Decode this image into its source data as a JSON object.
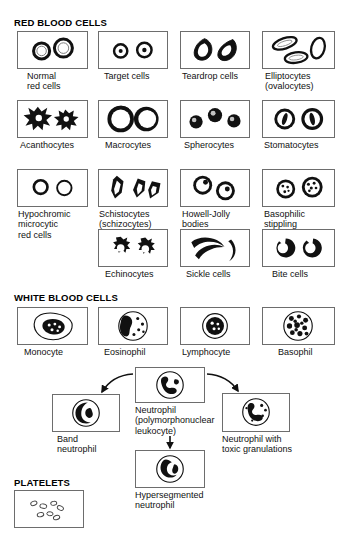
{
  "page": {
    "background": "#ffffff",
    "ink": "#000000",
    "box_border": "#6d6d6d"
  },
  "sections": {
    "rbc_header": "RED BLOOD CELLS",
    "wbc_header": "WHITE BLOOD CELLS",
    "platelets_header": "PLATELETS"
  },
  "red_blood_cells": {
    "row1": [
      {
        "id": "normal-red-cells",
        "label": "Normal\nred cells",
        "icon": "normal-rbc-icon"
      },
      {
        "id": "target-cells",
        "label": "Target cells",
        "icon": "target-cell-icon"
      },
      {
        "id": "teardrop-cells",
        "label": "Teardrop cells",
        "icon": "teardrop-cell-icon"
      },
      {
        "id": "elliptocytes",
        "label": "Elliptocytes\n(ovalocytes)",
        "icon": "elliptocyte-icon"
      }
    ],
    "row2": [
      {
        "id": "acanthocytes",
        "label": "Acanthocytes",
        "icon": "acanthocyte-icon"
      },
      {
        "id": "macrocytes",
        "label": "Macrocytes",
        "icon": "macrocyte-icon"
      },
      {
        "id": "spherocytes",
        "label": "Spherocytes",
        "icon": "spherocyte-icon"
      },
      {
        "id": "stomatocytes",
        "label": "Stomatocytes",
        "icon": "stomatocyte-icon"
      }
    ],
    "row3": [
      {
        "id": "hypochromic-microcytic-red-cells",
        "label": "Hypochromic\nmicrocytic\nred cells",
        "icon": "hypochromic-icon"
      },
      {
        "id": "schistocytes",
        "label": "Schistocytes\n(schizocytes)",
        "icon": "schistocyte-icon"
      },
      {
        "id": "howell-jolly-bodies",
        "label": "Howell-Jolly\nbodies",
        "icon": "howell-jolly-icon"
      },
      {
        "id": "basophilic-stippling",
        "label": "Basophilic\nstippling",
        "icon": "basophilic-stippling-icon"
      }
    ],
    "row4": [
      {
        "id": "echinocytes",
        "label": "Echinocytes",
        "icon": "echinocyte-icon"
      },
      {
        "id": "sickle-cells",
        "label": "Sickle cells",
        "icon": "sickle-cell-icon"
      },
      {
        "id": "bite-cells",
        "label": "Bite cells",
        "icon": "bite-cell-icon"
      }
    ]
  },
  "white_blood_cells": {
    "row1": [
      {
        "id": "monocyte",
        "label": "Monocyte",
        "icon": "monocyte-icon"
      },
      {
        "id": "eosinophil",
        "label": "Eosinophil",
        "icon": "eosinophil-icon"
      },
      {
        "id": "lymphocyte",
        "label": "Lymphocyte",
        "icon": "lymphocyte-icon"
      },
      {
        "id": "basophil",
        "label": "Basophil",
        "icon": "basophil-icon"
      }
    ],
    "neutrophil_group": {
      "center": {
        "id": "neutrophil",
        "label": "Neutrophil\n(polymorphonuclear\nleukocyte)",
        "icon": "neutrophil-icon"
      },
      "left": {
        "id": "band-neutrophil",
        "label": "Band\nneutrophil",
        "icon": "band-neutrophil-icon"
      },
      "right": {
        "id": "neutrophil-toxic-granulations",
        "label": "Neutrophil with\ntoxic granulations",
        "icon": "toxic-granulation-icon"
      },
      "bottom": {
        "id": "hypersegmented-neutrophil",
        "label": "Hypersegmented\nneutrophil",
        "icon": "hypersegmented-neutrophil-icon"
      }
    }
  },
  "platelets": {
    "id": "platelets",
    "icon": "platelet-cluster-icon"
  }
}
